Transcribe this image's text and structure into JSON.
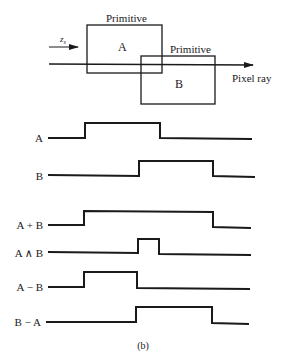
{
  "diagram": {
    "caption": "(b)",
    "top": {
      "primitive_a": {
        "title": "Primitive",
        "label": "A"
      },
      "primitive_b": {
        "title": "Primitive",
        "label": "B"
      },
      "depth_label": "z",
      "depth_subscript": "s",
      "ray_label": "Pixel ray"
    },
    "waveforms": [
      {
        "label": "A"
      },
      {
        "label": "B"
      },
      {
        "label": "A + B"
      },
      {
        "label": "A ∧ B"
      },
      {
        "label": "A − B"
      },
      {
        "label": "B − A"
      }
    ]
  },
  "colors": {
    "ink": "#1a1a1a",
    "background": "#ffffff"
  }
}
